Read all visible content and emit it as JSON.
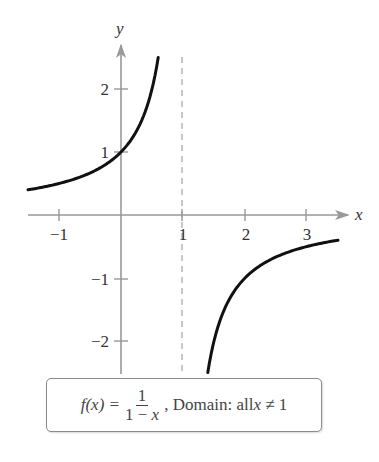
{
  "chart_data": {
    "type": "line",
    "title": "",
    "function": "f(x) = 1/(1 - x)",
    "xlabel": "x",
    "ylabel": "y",
    "xlim": [
      -1.5,
      3.7
    ],
    "ylim": [
      -2.5,
      2.7
    ],
    "grid": false,
    "x_ticks": [
      -1,
      1,
      2,
      3
    ],
    "y_ticks": [
      -2,
      -1,
      1,
      2
    ],
    "x_tick_labels": [
      "−1",
      "1",
      "2",
      "3"
    ],
    "y_tick_labels": [
      "−2",
      "−1",
      "1",
      "2"
    ],
    "vertical_asymptote": {
      "x": 1,
      "style": "dashed"
    },
    "horizontal_asymptote": {
      "y": 0
    },
    "series": [
      {
        "name": "left branch",
        "x": [
          -1.5,
          -1,
          -0.5,
          0,
          0.25,
          0.5,
          0.6
        ],
        "y": [
          0.4,
          0.5,
          0.667,
          1,
          1.333,
          2,
          2.5
        ]
      },
      {
        "name": "right branch",
        "x": [
          1.4,
          1.5,
          2,
          2.5,
          3,
          3.5
        ],
        "y": [
          -2.5,
          -2,
          -1,
          -0.667,
          -0.5,
          -0.4
        ]
      }
    ],
    "annotations": [
      {
        "text": "f(x) = 1/(1 − x), Domain: all x ≠ 1",
        "position": "bottom-center boxed"
      }
    ],
    "line_color": "#111111",
    "axis_color": "#999999",
    "asymptote_color": "#aaaaaa"
  },
  "axes": {
    "x_label": "x",
    "y_label": "y",
    "x_ticks": [
      {
        "value": -1,
        "label": "−1"
      },
      {
        "value": 1,
        "label": "1"
      },
      {
        "value": 2,
        "label": "2"
      },
      {
        "value": 3,
        "label": "3"
      }
    ],
    "y_ticks": [
      {
        "value": 2,
        "label": "2"
      },
      {
        "value": 1,
        "label": "1"
      },
      {
        "value": -1,
        "label": "−1"
      },
      {
        "value": -2,
        "label": "−2"
      }
    ]
  },
  "caption": {
    "fx": "f(x) =",
    "numerator": "1",
    "denominator_prefix": "1 − ",
    "denominator_var": "x",
    "domain_text": ", Domain: all ",
    "domain_var": "x",
    "domain_rest": " ≠ 1"
  }
}
